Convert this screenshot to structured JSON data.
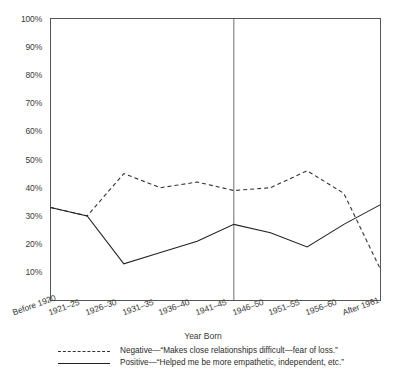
{
  "chart_data": {
    "type": "line",
    "title": "",
    "xlabel": "Year Born",
    "ylabel": "",
    "ylim": [
      0,
      100
    ],
    "yticks": [
      "10%",
      "20%",
      "30%",
      "40%",
      "50%",
      "60%",
      "70%",
      "80%",
      "90%",
      "100%"
    ],
    "ytick_values": [
      10,
      20,
      30,
      40,
      50,
      60,
      70,
      80,
      90,
      100
    ],
    "grid": false,
    "legend_position": "bottom",
    "categories": [
      "Before 1920",
      "1921–25",
      "1926–30",
      "1931–35",
      "1936–40",
      "1941–45",
      "1946–50",
      "1951–55",
      "1956–60",
      "After 1961"
    ],
    "series": [
      {
        "name": "Negative",
        "label": "Negative—“Makes close relationships difficult—fear of loss.”",
        "style": "dashed",
        "color": "#333333",
        "values": [
          33,
          30,
          45,
          40,
          42,
          39,
          40,
          46,
          38,
          11
        ]
      },
      {
        "name": "Positive",
        "label": "Positive—“Helped me be more empathetic, independent, etc.”",
        "style": "solid",
        "color": "#222222",
        "values": [
          33,
          30,
          13,
          17,
          21,
          27,
          24,
          19,
          27,
          34
        ]
      }
    ],
    "annotations": [
      {
        "type": "vertical-reference-line",
        "at_category": "1941–45",
        "color": "#6f6f6f"
      }
    ]
  },
  "legend": {
    "entries": [
      {
        "marker": "dashed-line-swatch",
        "label": "Negative—“Makes close relationships difficult—fear of loss.”"
      },
      {
        "marker": "solid-line-swatch",
        "label": "Positive—“Helped me be more empathetic, independent, etc.”"
      }
    ]
  }
}
